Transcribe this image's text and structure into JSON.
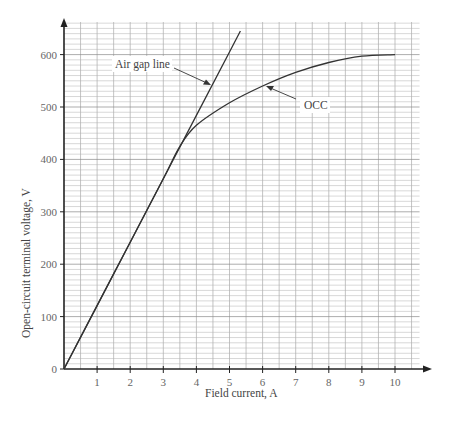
{
  "chart_data": {
    "type": "line",
    "title": "",
    "xlabel": "Field current, A",
    "ylabel": "Open-circuit terminal voltage, V",
    "xlim": [
      0,
      11
    ],
    "ylim": [
      0,
      660
    ],
    "x_ticks": [
      "1",
      "2",
      "3",
      "4",
      "5",
      "6",
      "7",
      "8",
      "9",
      "10"
    ],
    "y_ticks": [
      "0",
      "100",
      "200",
      "300",
      "400",
      "500",
      "600"
    ],
    "grid": true,
    "series": [
      {
        "name": "Air gap line",
        "x": [
          0,
          1,
          2,
          3,
          4,
          5,
          5.33
        ],
        "y": [
          0,
          121,
          242,
          363,
          484,
          605,
          645
        ]
      },
      {
        "name": "OCC",
        "x": [
          0,
          1,
          2,
          3,
          3.5,
          4,
          5,
          6,
          7,
          8,
          9,
          10
        ],
        "y": [
          0,
          121,
          242,
          363,
          425,
          465,
          508,
          540,
          566,
          585,
          597,
          600
        ]
      }
    ],
    "annotations": [
      {
        "text": "Air gap line",
        "points_to": [
          4.4,
          535
        ]
      },
      {
        "text": "OCC",
        "points_to": [
          6.1,
          543
        ]
      }
    ]
  },
  "labels": {
    "xlabel": "Field current, A",
    "ylabel": "Open-circuit terminal voltage, V",
    "airgap": "Air gap line",
    "occ": "OCC",
    "x0": "0",
    "y": [
      "0",
      "100",
      "200",
      "300",
      "400",
      "500",
      "600"
    ],
    "x": [
      "1",
      "2",
      "3",
      "4",
      "5",
      "6",
      "7",
      "8",
      "9",
      "10"
    ]
  }
}
